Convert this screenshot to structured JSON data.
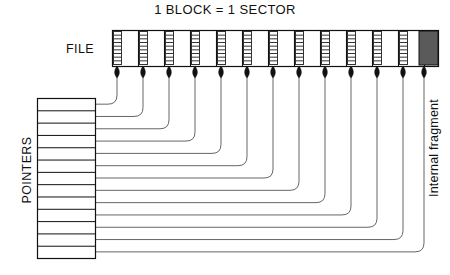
{
  "diagram": {
    "title": "1 BLOCK = 1 SECTOR",
    "file_label": "FILE",
    "pointers_label": "POINTERS",
    "fragment_label": "Internal fragment",
    "colors": {
      "stroke": "#111111",
      "thin_stroke": "#555555",
      "fragment_fill": "#5a5a5a",
      "hatch_stroke": "#333333",
      "background": "#ffffff"
    },
    "file_strip": {
      "x": 112,
      "y": 30,
      "width": 326,
      "height": 36,
      "block_count": 13,
      "block_width": 26,
      "hatch_width": 8,
      "hatch_rows": 9
    },
    "internal_fragment": {
      "x": 419,
      "y": 31,
      "width": 19,
      "height": 34
    },
    "arrows": {
      "count": 13,
      "tip_y": 66,
      "x_positions": [
        117,
        143,
        169,
        195,
        221,
        247,
        273,
        299,
        325,
        351,
        377,
        403,
        424
      ]
    },
    "pointer_table": {
      "x": 37,
      "y": 98,
      "width": 58,
      "height": 160,
      "row_count": 13,
      "row_height": 12.31
    },
    "connectors": {
      "corner_radius": 9,
      "note": "each pointer row routes right then curves up to its block arrow"
    }
  }
}
